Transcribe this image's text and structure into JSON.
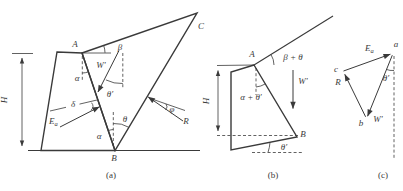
{
  "colors": {
    "ink": "#3a3a3a",
    "background": "#ffffff"
  },
  "panel_a": {
    "caption": "(a)",
    "vertex_A": "A",
    "vertex_B": "B",
    "vertex_C": "C",
    "height_dim": "H",
    "angle_beta": "β",
    "angle_alpha_wall": "α",
    "angle_alpha_base": "α",
    "angle_theta": "θ",
    "angle_theta_prime": "θ′",
    "angle_delta": "δ",
    "angle_phi": "φ",
    "force_weight": "W′",
    "force_Ea_main": "E",
    "force_Ea_sub": "a",
    "force_R": "R"
  },
  "panel_b": {
    "caption": "(b)",
    "vertex_A": "A",
    "vertex_B": "B",
    "height_dim": "H",
    "angle_beta_plus_theta": "β + θ",
    "angle_alpha_plus_theta_prime": "α + θ′",
    "angle_theta_prime": "θ′",
    "force_weight": "W′"
  },
  "panel_c": {
    "caption": "(c)",
    "vertex_a": "a",
    "vertex_b": "b",
    "vertex_c": "c",
    "force_Ea_main": "E",
    "force_Ea_sub": "a",
    "force_weight": "W′",
    "force_R": "R",
    "angle_theta_prime": "θ′"
  }
}
